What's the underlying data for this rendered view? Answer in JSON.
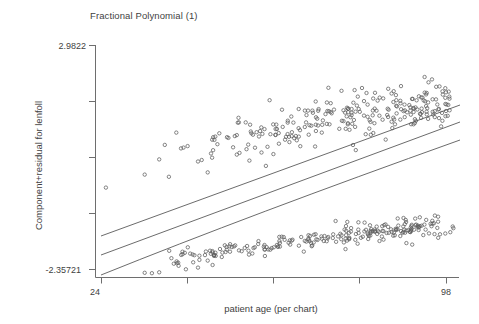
{
  "chart": {
    "title": "Fractional Polynomial (1)",
    "xlabel": "patient age (per chart)",
    "ylabel": "Component+residual for lenfoll",
    "x_tick_min": "24",
    "x_tick_max": "98",
    "y_tick_max": "2.9822",
    "y_tick_min": "-2.35721"
  },
  "chart_data": {
    "type": "scatter",
    "title": "Fractional Polynomial (1)",
    "xlabel": "patient age (per chart)",
    "ylabel": "Component+residual for lenfoll",
    "xlim": [
      24,
      98
    ],
    "ylim": [
      -2.35721,
      2.9822
    ],
    "xticks": [
      24,
      98
    ],
    "xtick_labels": [
      "24",
      "98"
    ],
    "yticks": [
      -2.35721,
      2.9822
    ],
    "ytick_labels": [
      "-2.35721",
      "2.9822"
    ],
    "grid": false,
    "legend": null,
    "marker": "open-circle",
    "marker_color": "#5c5c5c",
    "line_color": "#5a5a5a",
    "series": [
      {
        "name": "component+residual points",
        "type": "scatter",
        "x": [
          25.0,
          33.5,
          34.0,
          36.0,
          38.0,
          40.0,
          41.0,
          42.0,
          43.0,
          44.0,
          45.0,
          46.0,
          47.0,
          48.0,
          49.0,
          50.0,
          51.0,
          52.0,
          53.0,
          54.0,
          55.0,
          56.0,
          57.0,
          58.0,
          59.0,
          60.0,
          61.0,
          62.0,
          63.0,
          64.0,
          65.0,
          66.0,
          67.0,
          68.0,
          69.0,
          70.0,
          71.0,
          72.0,
          73.0,
          74.0,
          75.0,
          76.0,
          77.0,
          78.0,
          79.0,
          80.0,
          81.0,
          82.0,
          83.0,
          84.0,
          85.0,
          86.0,
          87.0,
          88.0,
          89.0,
          90.0,
          91.0,
          92.0,
          93.0,
          94.0,
          95.0,
          96.0,
          97.0
        ],
        "note": "approximately 430 plotted points forming an upper diffuse cloud (values roughly 0.2 to 3.0) and a dense lower band (values roughly -2.3 to -0.8) that drifts upward with age"
      },
      {
        "name": "fitted line (upper)",
        "type": "line",
        "x": [
          24,
          98
        ],
        "y": [
          -1.37,
          2.03
        ]
      },
      {
        "name": "fitted line (middle)",
        "type": "line",
        "x": [
          24,
          98
        ],
        "y": [
          -1.78,
          1.67
        ]
      },
      {
        "name": "fitted line (lower)",
        "type": "line",
        "x": [
          24,
          98
        ],
        "y": [
          -2.3,
          1.3
        ]
      }
    ]
  }
}
